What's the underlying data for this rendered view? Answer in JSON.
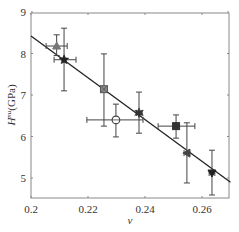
{
  "chart_data": {
    "type": "scatter",
    "title": "",
    "xlabel": "v",
    "ylabel": "H^nu(GPa)",
    "ylabel_parts": {
      "main": "H",
      "sup": "nu",
      "unit": "(GPa)"
    },
    "xlim": [
      0.2,
      0.27
    ],
    "ylim": [
      4.5,
      9.1
    ],
    "xticks": [
      0.2,
      0.22,
      0.24,
      0.26
    ],
    "xtick_labels": [
      "0.2",
      "0.22",
      "0.24",
      "0.26"
    ],
    "yticks": [
      5,
      6,
      7,
      8,
      9
    ],
    "ytick_labels": [
      "5",
      "6",
      "7",
      "8",
      "9"
    ],
    "grid": false,
    "legend": null,
    "points": [
      {
        "x": 0.209,
        "y": 8.18,
        "xerr": [
          0.2053,
          0.2127
        ],
        "yerr": [
          7.95,
          8.45
        ],
        "marker": "triangle-up",
        "color": "#777777"
      },
      {
        "x": 0.2116,
        "y": 7.85,
        "xerr": [
          0.2081,
          0.2158
        ],
        "yerr": [
          7.1,
          8.61
        ],
        "marker": "star",
        "color": "#222222"
      },
      {
        "x": 0.2256,
        "y": 7.14,
        "xerr": [
          0.2256,
          0.2256
        ],
        "yerr": [
          6.25,
          7.99
        ],
        "marker": "square-x",
        "color": "#888888"
      },
      {
        "x": 0.2298,
        "y": 6.4,
        "xerr": [
          0.2196,
          0.2393
        ],
        "yerr": [
          5.99,
          6.78
        ],
        "marker": "circle-plus",
        "color": "#444444"
      },
      {
        "x": 0.2379,
        "y": 6.57,
        "xerr": [
          0.237,
          0.239
        ],
        "yerr": [
          6.08,
          7.07
        ],
        "marker": "hexagram",
        "color": "#333333"
      },
      {
        "x": 0.2509,
        "y": 6.25,
        "xerr": [
          0.2446,
          0.2575
        ],
        "yerr": [
          5.96,
          6.52
        ],
        "marker": "square",
        "color": "#333333"
      },
      {
        "x": 0.2547,
        "y": 5.6,
        "xerr": [
          0.2537,
          0.2557
        ],
        "yerr": [
          4.88,
          6.33
        ],
        "marker": "triangle-left",
        "color": "#444444"
      },
      {
        "x": 0.2635,
        "y": 5.12,
        "xerr": [
          0.2625,
          0.2645
        ],
        "yerr": [
          4.59,
          5.67
        ],
        "marker": "triangle-down",
        "color": "#222222"
      }
    ],
    "fit_line": {
      "x": [
        0.2,
        0.27
      ],
      "y": [
        8.42,
        4.9
      ],
      "color": "#222222"
    }
  }
}
